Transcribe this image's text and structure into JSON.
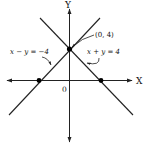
{
  "diagram": {
    "type": "coordinate-graph",
    "axes": {
      "x_label": "X",
      "y_label": "Y",
      "origin_label": "0"
    },
    "lines": [
      {
        "equation": "x − y = −4",
        "label": "x − y = −4"
      },
      {
        "equation": "x + y = 4",
        "label": "x + y = 4"
      }
    ],
    "points": [
      {
        "coords": [
          0,
          4
        ],
        "label": "(0, 4)"
      },
      {
        "coords": [
          -4,
          0
        ],
        "label": ""
      },
      {
        "coords": [
          4,
          0
        ],
        "label": ""
      }
    ],
    "colors": {
      "stroke": "#222222",
      "point": "#000000",
      "background": "#ffffff"
    }
  }
}
